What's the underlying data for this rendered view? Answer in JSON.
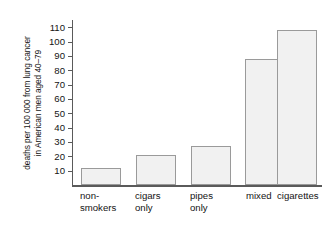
{
  "chart_data": {
    "type": "bar",
    "title": "",
    "subtitle": "",
    "xlabel": "",
    "ylabel": "deaths per 100 000 from lung cancer in American men aged 40–79",
    "ylabel_lines": [
      "deaths per 100 000 from lung cancer",
      "in American men aged 40–79"
    ],
    "categories": [
      "non-smokers",
      "cigars only",
      "pipes only",
      "mixed",
      "cigarettes"
    ],
    "category_lines": [
      [
        "non-",
        "smokers"
      ],
      [
        "cigars",
        "only"
      ],
      [
        "pipes",
        "only"
      ],
      [
        "mixed",
        ""
      ],
      [
        "cigarettes",
        ""
      ]
    ],
    "values": [
      12,
      21,
      27,
      88,
      108
    ],
    "ylim": [
      0,
      115
    ],
    "yticks": [
      10,
      20,
      30,
      40,
      50,
      60,
      70,
      80,
      90,
      100,
      110
    ],
    "ytick_labels": [
      "10",
      "20",
      "30",
      "40",
      "50",
      "60",
      "70",
      "80",
      "90",
      "100",
      "110"
    ],
    "grid": false,
    "legend": false,
    "legend_position": "none",
    "colors": {
      "bar_fill": "#f1f1f1",
      "bar_border": "#9a9a9a",
      "axis": "#5a5a5a",
      "text": "#141414",
      "background": "#ffffff"
    }
  }
}
